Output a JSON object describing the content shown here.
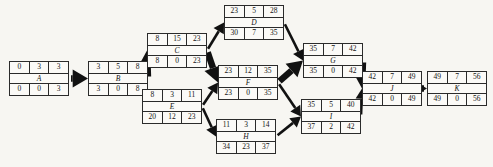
{
  "diagram": {
    "type": "activity-on-node-network",
    "header_labels": [
      "ES",
      "Duration",
      "EF"
    ],
    "footer_labels": [
      "LS",
      "Slack",
      "LF"
    ],
    "nodes": [
      {
        "id": "A",
        "label": "A",
        "top": [
          0,
          3,
          3
        ],
        "bottom": [
          0,
          0,
          3
        ],
        "x": 9,
        "y": 61
      },
      {
        "id": "B",
        "label": "B",
        "top": [
          3,
          5,
          8
        ],
        "bottom": [
          3,
          0,
          8
        ],
        "x": 88,
        "y": 61
      },
      {
        "id": "C",
        "label": "C",
        "top": [
          8,
          15,
          23
        ],
        "bottom": [
          8,
          0,
          23
        ],
        "x": 147,
        "y": 33
      },
      {
        "id": "E",
        "label": "E",
        "top": [
          8,
          3,
          11
        ],
        "bottom": [
          20,
          12,
          23
        ],
        "x": 142,
        "y": 89
      },
      {
        "id": "D",
        "label": "D",
        "top": [
          23,
          5,
          28
        ],
        "bottom": [
          30,
          7,
          35
        ],
        "x": 224,
        "y": 5
      },
      {
        "id": "F",
        "label": "F",
        "top": [
          23,
          12,
          35
        ],
        "bottom": [
          23,
          0,
          35
        ],
        "x": 218,
        "y": 65
      },
      {
        "id": "H",
        "label": "H",
        "top": [
          11,
          3,
          14
        ],
        "bottom": [
          34,
          23,
          37
        ],
        "x": 216,
        "y": 119
      },
      {
        "id": "G",
        "label": "G",
        "top": [
          35,
          7,
          42
        ],
        "bottom": [
          35,
          0,
          42
        ],
        "x": 303,
        "y": 43
      },
      {
        "id": "I",
        "label": "I",
        "top": [
          35,
          5,
          40
        ],
        "bottom": [
          37,
          2,
          42
        ],
        "x": 301,
        "y": 99
      },
      {
        "id": "J",
        "label": "J",
        "top": [
          42,
          7,
          49
        ],
        "bottom": [
          42,
          0,
          49
        ],
        "x": 362,
        "y": 71
      },
      {
        "id": "K",
        "label": "K",
        "top": [
          49,
          7,
          56
        ],
        "bottom": [
          49,
          0,
          56
        ],
        "x": 427,
        "y": 71
      }
    ],
    "edges": [
      {
        "from": "A",
        "to": "B",
        "critical": true
      },
      {
        "from": "B",
        "to": "C",
        "critical": true
      },
      {
        "from": "C",
        "to": "D",
        "critical": false
      },
      {
        "from": "C",
        "to": "F",
        "critical": true
      },
      {
        "from": "E",
        "to": "F",
        "critical": false
      },
      {
        "from": "E",
        "to": "H",
        "critical": false
      },
      {
        "from": "D",
        "to": "G",
        "critical": false
      },
      {
        "from": "F",
        "to": "G",
        "critical": true
      },
      {
        "from": "F",
        "to": "I",
        "critical": false
      },
      {
        "from": "H",
        "to": "I",
        "critical": false
      },
      {
        "from": "G",
        "to": "J",
        "critical": true
      },
      {
        "from": "I",
        "to": "J",
        "critical": false
      },
      {
        "from": "J",
        "to": "K",
        "critical": true
      }
    ],
    "colors": {
      "arrow": "#111111",
      "node_border": "#2b2b2b",
      "node_fill": "#fbfaf7",
      "background": "#f7f6f2",
      "text": "#141414"
    }
  }
}
